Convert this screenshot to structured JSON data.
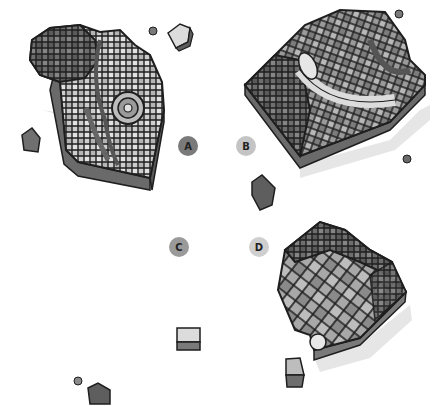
{
  "figure": {
    "panels": [
      {
        "label": "A",
        "badge_color": "#7a7a7a"
      },
      {
        "label": "B",
        "badge_color": "#c4c4c4"
      },
      {
        "label": "C",
        "badge_color": "#9a9a9a"
      },
      {
        "label": "D",
        "badge_color": "#cfcfcf"
      }
    ],
    "colors": {
      "dark_tile": "#5e5e5e",
      "mid_tile": "#8c8c8c",
      "light_tile": "#c8c8c8",
      "pale_tile": "#e4e4e4",
      "grout": "#1e1e1e",
      "shadow": "#e2e2e2"
    }
  }
}
